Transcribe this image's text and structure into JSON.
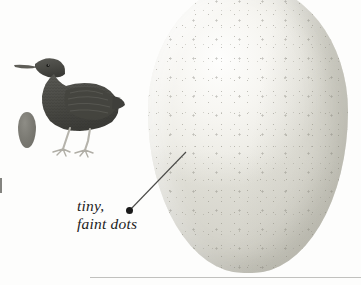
{
  "figure": {
    "type": "natural-history-illustration",
    "background_color": "#fdfdfc"
  },
  "annotation": {
    "line1": "tiny,",
    "line2": "faint dots",
    "style": "italic-serif",
    "text_color": "#1c1c1c",
    "dot_color": "#1a1a1a",
    "leader_line_color": "#4a4a48"
  },
  "subjects": {
    "large_egg": {
      "name": "large speckled egg",
      "base_color": "#f4f3ee",
      "shadow_color": "#e3e2da",
      "speckle_color": "#6e6c60"
    },
    "small_egg": {
      "name": "small dark egg",
      "color": "#7c7b74"
    },
    "bird": {
      "name": "long-billed wading bird engraving",
      "body_color": "#4a4a46",
      "leg_color": "#b5b3ab"
    }
  },
  "page": {
    "rule_color": "#78787355",
    "edge_mark_color": "#5a5a56"
  }
}
